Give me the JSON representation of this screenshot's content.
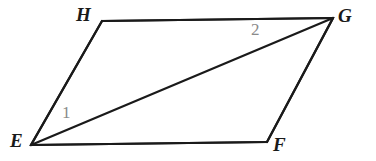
{
  "figure": {
    "kind": "geometry-diagram",
    "shape": "parallelogram",
    "background_color": "#ffffff",
    "stroke_color": "#1a1a1a",
    "stroke_width": 2.2,
    "vertex_label_color": "#1a1a1a",
    "angle_label_color": "#8a8a8a",
    "width": 376,
    "height": 161
  },
  "vertices": [
    {
      "id": "E",
      "label": "E",
      "x": 31,
      "y": 145
    },
    {
      "id": "F",
      "label": "F",
      "x": 267,
      "y": 142
    },
    {
      "id": "G",
      "label": "G",
      "x": 333,
      "y": 18
    },
    {
      "id": "H",
      "label": "H",
      "x": 102,
      "y": 21
    }
  ],
  "edges": [
    {
      "id": "EF",
      "from": "E",
      "to": "F",
      "name": "bottom-side"
    },
    {
      "id": "FG",
      "from": "F",
      "to": "G",
      "name": "right-side"
    },
    {
      "id": "GH",
      "from": "G",
      "to": "H",
      "name": "top-side"
    },
    {
      "id": "HE",
      "from": "H",
      "to": "E",
      "name": "left-side"
    }
  ],
  "diagonals": [
    {
      "id": "EG",
      "from": "E",
      "to": "G",
      "name": "diagonal"
    }
  ],
  "angle_labels": [
    {
      "id": "angle-1",
      "label": "1",
      "at_vertex": "E",
      "x": 67,
      "y": 113
    },
    {
      "id": "angle-2",
      "label": "2",
      "at_vertex": "G",
      "x": 258,
      "y": 30
    }
  ]
}
